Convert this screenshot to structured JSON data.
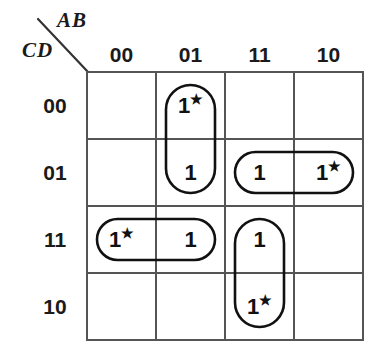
{
  "diagram": {
    "type": "karnaugh-map",
    "variables_top_label": "AB",
    "variables_side_label": "CD",
    "column_headers": [
      "00",
      "01",
      "11",
      "10"
    ],
    "row_headers": [
      "00",
      "01",
      "11",
      "10"
    ],
    "star_glyph": "★",
    "colors": {
      "grid_line": "#555555",
      "group_outline": "#111111",
      "text": "#111111",
      "background": "#ffffff"
    },
    "cells": [
      {
        "row": "00",
        "col": "00",
        "value": "",
        "starred": false
      },
      {
        "row": "00",
        "col": "01",
        "value": "1",
        "starred": true
      },
      {
        "row": "00",
        "col": "11",
        "value": "",
        "starred": false
      },
      {
        "row": "00",
        "col": "10",
        "value": "",
        "starred": false
      },
      {
        "row": "01",
        "col": "00",
        "value": "",
        "starred": false
      },
      {
        "row": "01",
        "col": "01",
        "value": "1",
        "starred": false
      },
      {
        "row": "01",
        "col": "11",
        "value": "1",
        "starred": false
      },
      {
        "row": "01",
        "col": "10",
        "value": "1",
        "starred": true
      },
      {
        "row": "11",
        "col": "00",
        "value": "1",
        "starred": true
      },
      {
        "row": "11",
        "col": "01",
        "value": "1",
        "starred": false
      },
      {
        "row": "11",
        "col": "11",
        "value": "1",
        "starred": false
      },
      {
        "row": "11",
        "col": "10",
        "value": "",
        "starred": false
      },
      {
        "row": "10",
        "col": "00",
        "value": "",
        "starred": false
      },
      {
        "row": "10",
        "col": "01",
        "value": "",
        "starred": false
      },
      {
        "row": "10",
        "col": "11",
        "value": "1",
        "starred": true
      },
      {
        "row": "10",
        "col": "10",
        "value": "",
        "starred": false
      }
    ],
    "groups": [
      {
        "id": "group-col01-rows-00-01",
        "orientation": "vertical",
        "cells": [
          "01/00",
          "01/01"
        ]
      },
      {
        "id": "group-row01-cols-11-10",
        "orientation": "horizontal",
        "cells": [
          "11/01",
          "10/01"
        ]
      },
      {
        "id": "group-row11-cols-00-01",
        "orientation": "horizontal",
        "cells": [
          "00/11",
          "01/11"
        ]
      },
      {
        "id": "group-col11-rows-11-10",
        "orientation": "vertical",
        "cells": [
          "11/11",
          "11/10"
        ]
      }
    ]
  }
}
